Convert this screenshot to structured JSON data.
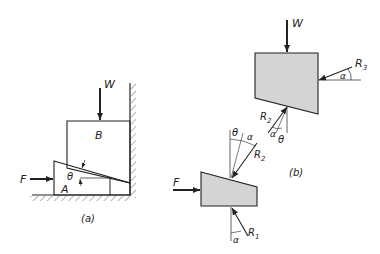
{
  "figure_a": {
    "caption": "(a)",
    "labels": {
      "force_w": "W",
      "block_b": "B",
      "angle": "θ",
      "force_f": "F",
      "wedge_a": "A"
    }
  },
  "figure_b": {
    "caption": "(b)",
    "block_labels": {
      "force_w": "W",
      "reaction_3": "R",
      "reaction_3_sub": "3",
      "alpha_3": "α",
      "reaction_2": "R",
      "reaction_2_sub": "2",
      "alpha_2": "α",
      "theta_2": "θ"
    },
    "wedge_labels": {
      "theta": "θ",
      "alpha": "α",
      "reaction_2": "R",
      "reaction_2_sub": "2",
      "force_f": "F",
      "reaction_1": "R",
      "reaction_1_sub": "1",
      "alpha_1": "α"
    }
  },
  "colors": {
    "line": "#222222",
    "fill": "#d4d4d4",
    "background": "#ffffff"
  }
}
